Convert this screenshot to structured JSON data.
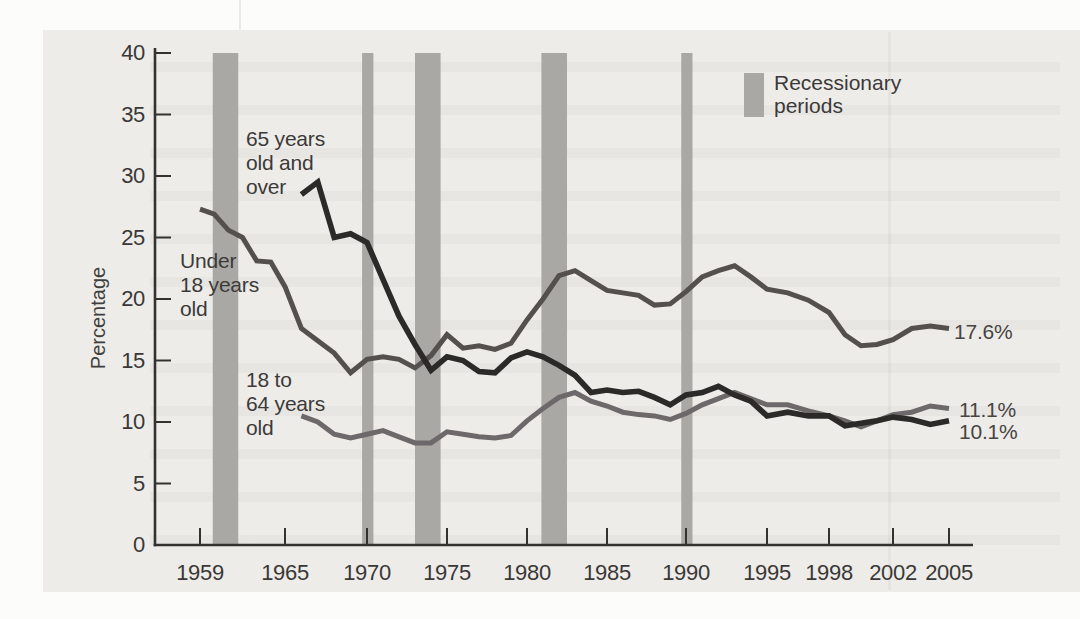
{
  "figure": {
    "margin_color": "#fcfcfb",
    "page_color": "#edece9",
    "axis_color": "#34322f",
    "text_color": "#3a3836"
  },
  "chart_data": {
    "type": "line",
    "title": "",
    "xlabel": "",
    "ylabel": "Percentage",
    "ylim": [
      0,
      40
    ],
    "y_ticks": [
      0,
      5,
      10,
      15,
      20,
      25,
      30,
      35,
      40
    ],
    "x_ticks": [
      1959,
      1965,
      1970,
      1975,
      1980,
      1985,
      1990,
      1995,
      1998,
      2002,
      2005
    ],
    "grid": false,
    "legend": {
      "label": "Recessionary\nperiods",
      "swatch_color": "#a9a8a5",
      "position": "top-right"
    },
    "recession_bands": [
      [
        1959.9,
        1961.7
      ],
      [
        1969.7,
        1970.4
      ],
      [
        1973.0,
        1974.6
      ],
      [
        1980.9,
        1982.5
      ],
      [
        1989.7,
        1990.4
      ]
    ],
    "series": [
      {
        "name": "Under 18 years old",
        "annotation": "Under\n18 years\nold",
        "end_label": "17.6%",
        "color": "#54504e",
        "points": [
          [
            1959,
            27.3
          ],
          [
            1960,
            26.9
          ],
          [
            1961,
            25.6
          ],
          [
            1962,
            25.0
          ],
          [
            1963,
            23.1
          ],
          [
            1964,
            23.0
          ],
          [
            1965,
            21.0
          ],
          [
            1966,
            17.6
          ],
          [
            1967,
            16.6
          ],
          [
            1968,
            15.6
          ],
          [
            1969,
            14.0
          ],
          [
            1970,
            15.1
          ],
          [
            1971,
            15.3
          ],
          [
            1972,
            15.1
          ],
          [
            1973,
            14.4
          ],
          [
            1974,
            15.4
          ],
          [
            1975,
            17.1
          ],
          [
            1976,
            16.0
          ],
          [
            1977,
            16.2
          ],
          [
            1978,
            15.9
          ],
          [
            1979,
            16.4
          ],
          [
            1980,
            18.3
          ],
          [
            1981,
            20.0
          ],
          [
            1982,
            21.9
          ],
          [
            1983,
            22.3
          ],
          [
            1984,
            21.5
          ],
          [
            1985,
            20.7
          ],
          [
            1986,
            20.5
          ],
          [
            1987,
            20.3
          ],
          [
            1988,
            19.5
          ],
          [
            1989,
            19.6
          ],
          [
            1990,
            20.6
          ],
          [
            1991,
            21.8
          ],
          [
            1992,
            22.3
          ],
          [
            1993,
            22.7
          ],
          [
            1994,
            21.8
          ],
          [
            1995,
            20.8
          ],
          [
            1996,
            20.5
          ],
          [
            1997,
            19.9
          ],
          [
            1998,
            18.9
          ],
          [
            1999,
            17.1
          ],
          [
            2000,
            16.2
          ],
          [
            2001,
            16.3
          ],
          [
            2002,
            16.7
          ],
          [
            2003,
            17.6
          ],
          [
            2004,
            17.8
          ],
          [
            2005,
            17.6
          ]
        ]
      },
      {
        "name": "65 years old and over",
        "annotation": "65 years\nold and\nover",
        "end_label": "10.1%",
        "color": "#2b2a28",
        "points": [
          [
            1966,
            28.5
          ],
          [
            1967,
            29.5
          ],
          [
            1968,
            25.0
          ],
          [
            1969,
            25.3
          ],
          [
            1970,
            24.6
          ],
          [
            1971,
            21.6
          ],
          [
            1972,
            18.6
          ],
          [
            1973,
            16.3
          ],
          [
            1974,
            14.2
          ],
          [
            1975,
            15.3
          ],
          [
            1976,
            15.0
          ],
          [
            1977,
            14.1
          ],
          [
            1978,
            14.0
          ],
          [
            1979,
            15.2
          ],
          [
            1980,
            15.7
          ],
          [
            1981,
            15.3
          ],
          [
            1982,
            14.6
          ],
          [
            1983,
            13.8
          ],
          [
            1984,
            12.4
          ],
          [
            1985,
            12.6
          ],
          [
            1986,
            12.4
          ],
          [
            1987,
            12.5
          ],
          [
            1988,
            12.0
          ],
          [
            1989,
            11.4
          ],
          [
            1990,
            12.2
          ],
          [
            1991,
            12.4
          ],
          [
            1992,
            12.9
          ],
          [
            1993,
            12.2
          ],
          [
            1994,
            11.7
          ],
          [
            1995,
            10.5
          ],
          [
            1996,
            10.8
          ],
          [
            1997,
            10.5
          ],
          [
            1998,
            10.5
          ],
          [
            1999,
            9.7
          ],
          [
            2000,
            9.9
          ],
          [
            2001,
            10.1
          ],
          [
            2002,
            10.4
          ],
          [
            2003,
            10.2
          ],
          [
            2004,
            9.8
          ],
          [
            2005,
            10.1
          ]
        ]
      },
      {
        "name": "18 to 64 years old",
        "annotation": "18 to\n64 years\nold",
        "end_label": "11.1%",
        "color": "#6d696b",
        "points": [
          [
            1966,
            10.5
          ],
          [
            1967,
            10.0
          ],
          [
            1968,
            9.0
          ],
          [
            1969,
            8.7
          ],
          [
            1970,
            9.0
          ],
          [
            1971,
            9.3
          ],
          [
            1972,
            8.8
          ],
          [
            1973,
            8.3
          ],
          [
            1974,
            8.3
          ],
          [
            1975,
            9.2
          ],
          [
            1976,
            9.0
          ],
          [
            1977,
            8.8
          ],
          [
            1978,
            8.7
          ],
          [
            1979,
            8.9
          ],
          [
            1980,
            10.1
          ],
          [
            1981,
            11.1
          ],
          [
            1982,
            12.0
          ],
          [
            1983,
            12.4
          ],
          [
            1984,
            11.7
          ],
          [
            1985,
            11.3
          ],
          [
            1986,
            10.8
          ],
          [
            1987,
            10.6
          ],
          [
            1988,
            10.5
          ],
          [
            1989,
            10.2
          ],
          [
            1990,
            10.7
          ],
          [
            1991,
            11.4
          ],
          [
            1992,
            11.9
          ],
          [
            1993,
            12.4
          ],
          [
            1994,
            11.9
          ],
          [
            1995,
            11.4
          ],
          [
            1996,
            11.4
          ],
          [
            1997,
            10.9
          ],
          [
            1998,
            10.5
          ],
          [
            1999,
            10.1
          ],
          [
            2000,
            9.6
          ],
          [
            2001,
            10.1
          ],
          [
            2002,
            10.6
          ],
          [
            2003,
            10.8
          ],
          [
            2004,
            11.3
          ],
          [
            2005,
            11.1
          ]
        ]
      }
    ]
  }
}
